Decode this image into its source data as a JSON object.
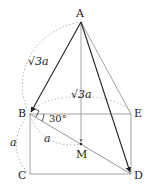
{
  "diagram": {
    "type": "geometry-figure",
    "points": {
      "A": {
        "label": "A",
        "x": 81,
        "y": 22
      },
      "B": {
        "label": "B",
        "x": 30,
        "y": 114
      },
      "E": {
        "label": "E",
        "x": 131,
        "y": 114
      },
      "C": {
        "label": "C",
        "x": 30,
        "y": 174
      },
      "D": {
        "label": "D",
        "x": 131,
        "y": 174
      },
      "M": {
        "label": "M",
        "x": 81,
        "y": 144
      }
    },
    "labels": {
      "AB_length": "√3a",
      "AM_length": "√3a",
      "angle": "30°",
      "BM_length": "a",
      "BC_length": "a"
    },
    "colors": {
      "dark_line": "#222222",
      "grey_line": "#9a9a9a",
      "dotted": "#aaaaaa",
      "text": "#222222"
    }
  }
}
